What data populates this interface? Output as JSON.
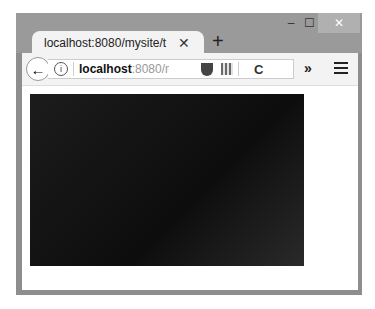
{
  "window": {
    "controls": {
      "minimize": "‒",
      "maximize": "☐",
      "close": "✕"
    }
  },
  "tab": {
    "title": "localhost:8080/mysite/t",
    "close": "✕",
    "new_tab": "+"
  },
  "navbar": {
    "back": "←",
    "info": "i",
    "url_host": "localhost",
    "url_rest": ":8080/mys",
    "reload": "C",
    "overflow": "»"
  },
  "content": {
    "canvas_color": "#111111"
  }
}
